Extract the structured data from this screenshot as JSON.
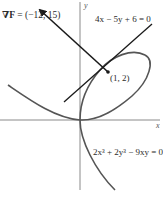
{
  "figure": {
    "gradient_label_symbol": "∇F",
    "gradient_label_value": " = (−12, 15)",
    "tangent_line_label": "4x − 5y + 6 = 0",
    "point_label": "(1, 2)",
    "curve_label": "2x³ + 2y³ − 9xy = 0",
    "x_axis_label": "x",
    "y_axis_label": "y"
  },
  "colors": {
    "axis": "#8a8a8a",
    "curve": "#555555",
    "line": "#1a1a1a",
    "text": "#2b2b2b"
  }
}
